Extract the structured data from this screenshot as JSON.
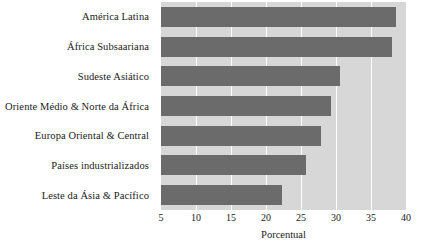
{
  "chart_data": {
    "type": "bar",
    "orientation": "horizontal",
    "title": "",
    "subtitle": "",
    "xlabel": "Porcentual",
    "ylabel": "",
    "xlim": [
      5,
      40
    ],
    "xticks": [
      5,
      10,
      15,
      20,
      25,
      30,
      35,
      40
    ],
    "xtick_labels": [
      "5",
      "10",
      "15",
      "20",
      "25",
      "30",
      "35",
      "40"
    ],
    "grid": true,
    "legend": false,
    "legend_position": "none",
    "categories": [
      "América Latina",
      "África Subsaariana",
      "Sudeste Asiático",
      "Oriente Médio & Norte da África",
      "Europa Oriental & Central",
      "Países industrializados",
      "Leste da Ásia & Pacífico"
    ],
    "values": [
      38.6,
      38.0,
      30.5,
      29.3,
      27.8,
      25.7,
      22.3
    ],
    "colors": {
      "bar": "#6b6b6b",
      "plot_background": "#d7d7d7",
      "gridline": "#ffffff",
      "text": "#1a1a1a",
      "figure_background": "#ffffff"
    }
  }
}
